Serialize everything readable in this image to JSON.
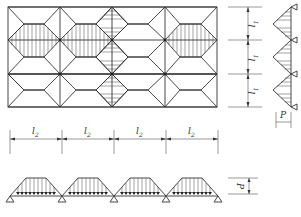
{
  "figure": {
    "plan": {
      "columns": 4,
      "rows": 3,
      "span_x_label": "l",
      "span_x_sub": "2",
      "span_y_label": "l",
      "span_y_sub": "1"
    },
    "dimensions": {
      "vertical": [
        {
          "label": "l",
          "sub": "1"
        },
        {
          "label": "l",
          "sub": "1"
        },
        {
          "label": "l",
          "sub": "1"
        }
      ],
      "horizontal": [
        {
          "label": "l",
          "sub": "2"
        },
        {
          "label": "l",
          "sub": "2"
        },
        {
          "label": "l",
          "sub": "2"
        },
        {
          "label": "l",
          "sub": "2"
        }
      ]
    },
    "side_beam": {
      "load_shape": "triangular",
      "spans": 3,
      "load_label": "P"
    },
    "bottom_beam": {
      "load_shape": "trapezoidal",
      "spans": 4,
      "load_label": "P"
    }
  }
}
